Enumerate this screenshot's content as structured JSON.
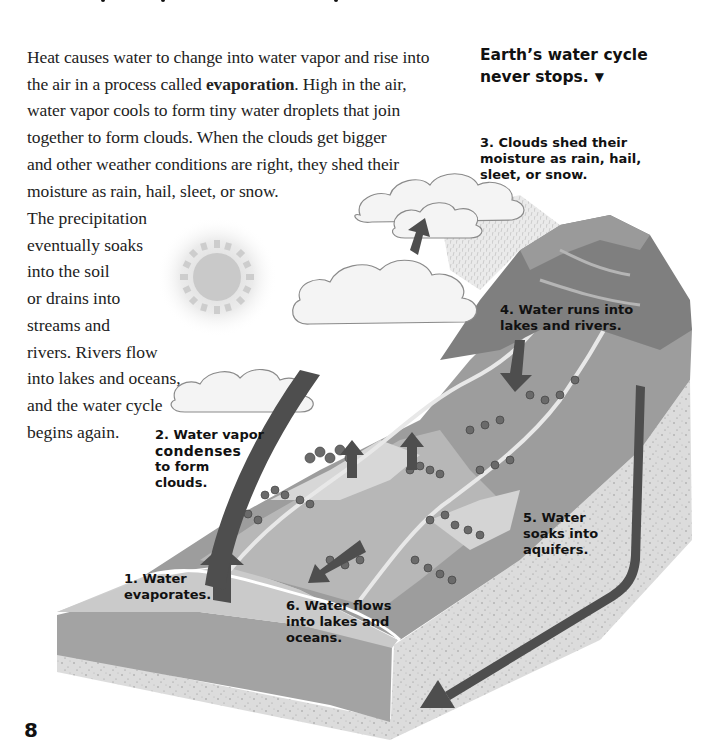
{
  "page": {
    "page_number": "8"
  },
  "body": {
    "paragraph_lines": [
      "Heat causes water to change into water vapor and rise into",
      "the air in a process called ",
      "evaporation",
      ".  High in the air,",
      "water vapor cools to form tiny water droplets that join",
      "together to form clouds.  When the clouds get bigger",
      "and other weather conditions are right, they shed their",
      "moisture as rain, hail, sleet, or snow."
    ],
    "wrap_lines": [
      "The precipitation",
      "eventually soaks",
      "into the soil",
      "or drains into",
      "streams and",
      "rivers.  Rivers flow",
      "into lakes and oceans,",
      "and the water cycle",
      "begins again."
    ]
  },
  "sidebar": {
    "title_line1": "Earth’s water cycle",
    "title_line2": "never stops.",
    "pointer_icon": "down-triangle-icon",
    "pointer_glyph": "▼"
  },
  "diagram": {
    "colors": {
      "arrow": "#4a4a4a",
      "land": "#8f8f8f",
      "ground": "#cfcfcf",
      "water": "#a9a9a9",
      "mountain": "#7d7d7d",
      "cloud": "#f4f4f4",
      "sun": "#c8c8c8"
    },
    "steps": [
      {
        "number": "1.",
        "line1": "Water",
        "line2": "evaporates."
      },
      {
        "number": "2.",
        "line1": "Water vapor",
        "emphasis": "condenses",
        "line3": "to form",
        "line4": "clouds."
      },
      {
        "number": "3.",
        "line1": "Clouds shed their",
        "line2": "moisture as rain, hail,",
        "line3": "sleet, or snow."
      },
      {
        "number": "4.",
        "line1": "Water runs into",
        "line2": "lakes and rivers."
      },
      {
        "number": "5.",
        "line1": "Water",
        "line2": "soaks into",
        "line3": "aquifers."
      },
      {
        "number": "6.",
        "line1": "Water flows",
        "line2": "into lakes and",
        "line3": "oceans."
      }
    ]
  }
}
